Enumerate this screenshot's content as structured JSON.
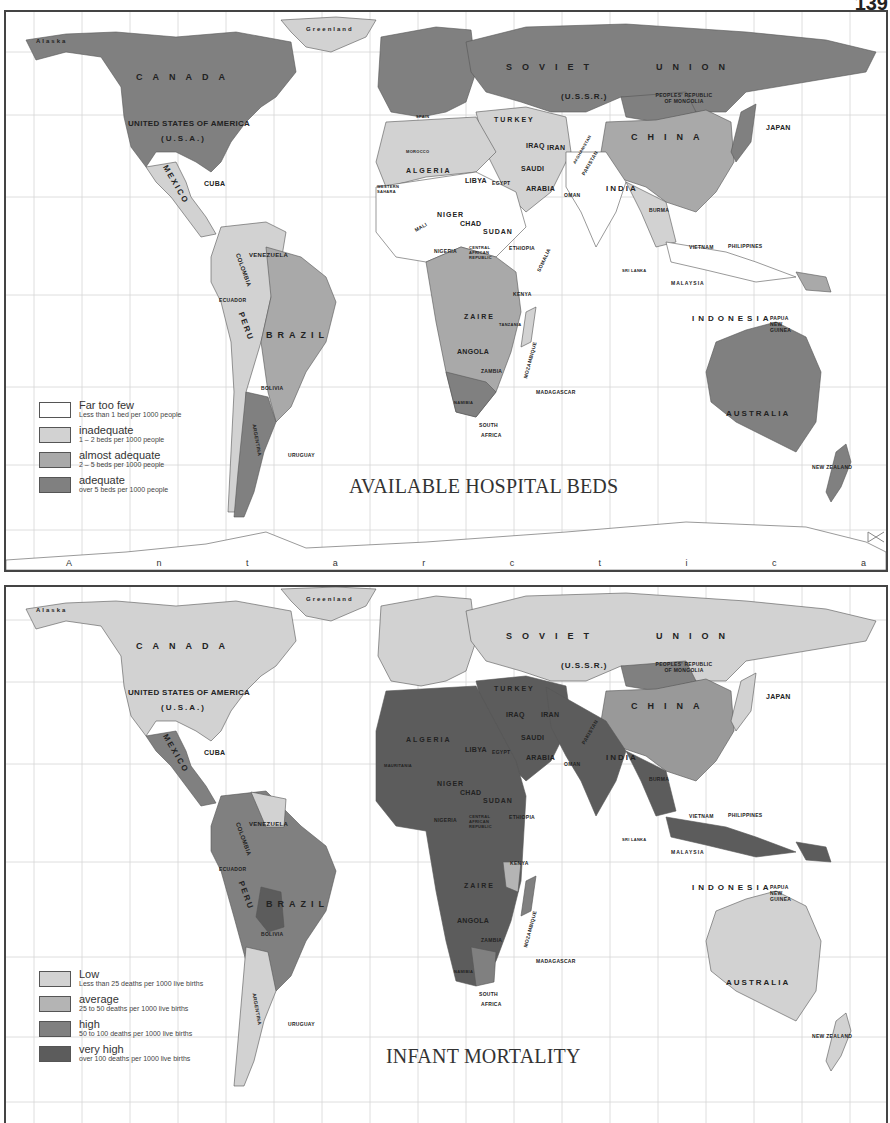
{
  "page_number": "139",
  "colors": {
    "level0": "#ffffff",
    "level1": "#d2d2d2",
    "level2": "#a9a9a9",
    "level3": "#808080",
    "level4": "#5c5c5c",
    "ocean": "#ffffff",
    "grid": "#cfcfcf",
    "border": "#444444"
  },
  "maps": [
    {
      "title": "AVAILABLE HOSPITAL BEDS",
      "legend": [
        {
          "label": "Far too few",
          "sub": "Less than 1 bed per 1000 people",
          "color": "#ffffff"
        },
        {
          "label": "inadequate",
          "sub": "1 – 2 beds per 1000 people",
          "color": "#d2d2d2"
        },
        {
          "label": "almost adequate",
          "sub": "2 – 5 beds per 1000 people",
          "color": "#a9a9a9"
        },
        {
          "label": "adequate",
          "sub": "over 5 beds per 1000 people",
          "color": "#808080"
        }
      ],
      "labels": {
        "alaska": "Alaska",
        "greenland": "Greenland",
        "canada": "CANADA",
        "usa": "UNITED STATES OF AMERICA",
        "usa_abbr": "(U.S.A.)",
        "mexico": "MEXICO",
        "cuba": "CUBA",
        "venezuela": "VENEZUELA",
        "colombia": "COLOMBIA",
        "ecuador": "ECUADOR",
        "peru": "PERU",
        "brazil": "BRAZIL",
        "bolivia": "BOLIVIA",
        "argentina": "ARGENTINA",
        "uruguay": "URUGUAY",
        "soviet": "SOVIET",
        "union": "UNION",
        "ussr": "(U.S.S.R.)",
        "mongolia": "PEOPLES' REPUBLIC OF MONGOLIA",
        "china": "CHINA",
        "japan": "JAPAN",
        "india": "INDIA",
        "burma": "BURMA",
        "vietnam": "VIETNAM",
        "philippines": "PHILIPPINES",
        "malaysia": "MALAYSIA",
        "indonesia": "INDONESIA",
        "papua": "PAPUA NEW GUINEA",
        "australia": "AUSTRALIA",
        "new_zealand": "NEW ZEALAND",
        "turkey": "TURKEY",
        "iraq": "IRAQ",
        "iran": "IRAN",
        "saudi": "SAUDI",
        "arabia": "ARABIA",
        "oman": "OMAN",
        "pakistan": "PAKISTAN",
        "afghanistan": "AFGHANISTAN",
        "algeria": "ALGERIA",
        "libya": "LIBYA",
        "egypt": "EGYPT",
        "niger": "NIGER",
        "chad": "CHAD",
        "sudan": "SUDAN",
        "ethiopia": "ETHIOPIA",
        "somalia": "SOMALIA",
        "nigeria": "NIGERIA",
        "mali": "MALI",
        "car": "CENTRAL AFRICAN REPUBLIC",
        "zaire": "ZAIRE",
        "kenya": "KENYA",
        "tanzania": "TANZANIA",
        "angola": "ANGOLA",
        "zambia": "ZAMBIA",
        "mozambique": "MOZAMBIQUE",
        "madagascar": "MADAGASCAR",
        "namibia": "NAMIBIA",
        "south_africa_1": "SOUTH",
        "south_africa_2": "AFRICA",
        "morocco": "MOROCCO",
        "western_sahara": "WESTERN SAHARA",
        "sri_lanka": "SRI LANKA",
        "spain": "SPAIN",
        "antarctica": [
          "A",
          "n",
          "t",
          "a",
          "r",
          "c",
          "t",
          "i",
          "c",
          "a"
        ]
      }
    },
    {
      "title": "INFANT MORTALITY",
      "legend": [
        {
          "label": "Low",
          "sub": "Less than 25 deaths per 1000 live births",
          "color": "#d2d2d2"
        },
        {
          "label": "average",
          "sub": "25 to 50 deaths per 1000 live births",
          "color": "#b4b4b4"
        },
        {
          "label": "high",
          "sub": "50 to 100 deaths per 1000  live births",
          "color": "#808080"
        },
        {
          "label": "very high",
          "sub": "over 100 deaths per 1000 live births",
          "color": "#5c5c5c"
        }
      ],
      "labels": {
        "alaska": "Alaska",
        "greenland": "Greenland",
        "canada": "CANADA",
        "usa": "UNITED STATES OF AMERICA",
        "usa_abbr": "(U.S.A.)",
        "mexico": "MEXICO",
        "cuba": "CUBA",
        "venezuela": "VENEZUELA",
        "colombia": "COLOMBIA",
        "ecuador": "ECUADOR",
        "peru": "PERU",
        "brazil": "BRAZIL",
        "bolivia": "BOLIVIA",
        "argentina": "ARGENTINA",
        "uruguay": "URUGUAY",
        "soviet": "SOVIET",
        "union": "UNION",
        "ussr": "(U.S.S.R.)",
        "mongolia": "PEOPLES' REPUBLIC OF MONGOLIA",
        "china": "CHINA",
        "japan": "JAPAN",
        "india": "INDIA",
        "burma": "BURMA",
        "vietnam": "VIETNAM",
        "philippines": "PHILIPPINES",
        "malaysia": "MALAYSIA",
        "indonesia": "INDONESIA",
        "papua": "PAPUA NEW GUINEA",
        "australia": "AUSTRALIA",
        "new_zealand": "NEW ZEALAND",
        "turkey": "TURKEY",
        "iraq": "IRAQ",
        "iran": "IRAN",
        "saudi": "SAUDI",
        "arabia": "ARABIA",
        "oman": "OMAN",
        "pakistan": "PAKISTAN",
        "algeria": "ALGERIA",
        "libya": "LIBYA",
        "egypt": "EGYPT",
        "niger": "NIGER",
        "chad": "CHAD",
        "sudan": "SUDAN",
        "ethiopia": "ETHIOPIA",
        "nigeria": "NIGERIA",
        "car": "CENTRAL AFRICAN REPUBLIC",
        "zaire": "ZAIRE",
        "kenya": "KENYA",
        "angola": "ANGOLA",
        "zambia": "ZAMBIA",
        "mozambique": "MOZAMBIQUE",
        "madagascar": "MADAGASCAR",
        "namibia": "NAMIBIA",
        "south_africa_1": "SOUTH",
        "south_africa_2": "AFRICA",
        "mauritania": "MAURITANIA",
        "sri_lanka": "SRI LANKA"
      }
    }
  ]
}
